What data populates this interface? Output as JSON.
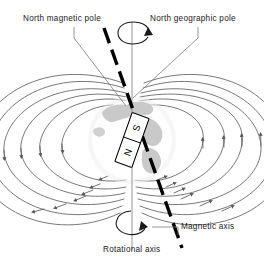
{
  "figure": {
    "type": "diagram",
    "background_color": "#ffffff",
    "line_color": "#555555",
    "axis_color": "#000000",
    "globe_fill": "#ffffff",
    "continent_fill": "#c9c9c9",
    "ocean_halo": "#efefef",
    "text_color": "#1a1a1a"
  },
  "labels": {
    "north_magnetic_pole": "North magnetic pole",
    "north_geographic_pole": "North geographic pole",
    "magnetic_axis": "Magnetic axis",
    "rotational_axis": "Rotational axis"
  },
  "magnet": {
    "top_pole": "S",
    "bottom_pole": "N",
    "tilt_degrees": 11,
    "body_fill": "#ffffff",
    "border_color": "#000000"
  },
  "axes": {
    "magnetic": {
      "style": "dashed",
      "width_px": 3.4,
      "tilt_degrees": 11,
      "color": "#000000"
    },
    "rotational": {
      "style": "solid",
      "width_px": 0.9,
      "tilt_degrees": 0,
      "color": "#8a8a8a"
    }
  },
  "field_lines": {
    "loops_per_side": 6,
    "arrow_direction_left": "downward",
    "arrow_direction_right": "upward",
    "arrowheads_per_loop": 2,
    "color": "#606060"
  },
  "rotation_indicators": {
    "count": 2,
    "positions": [
      "top",
      "bottom"
    ],
    "sense": "counterclockwise-viewed-from-north"
  },
  "icon_names": {
    "globe": "globe-icon",
    "bar_magnet": "bar-magnet-icon",
    "rotation_arrow": "rotation-arrow-icon",
    "field_arrow": "field-arrow-icon"
  }
}
